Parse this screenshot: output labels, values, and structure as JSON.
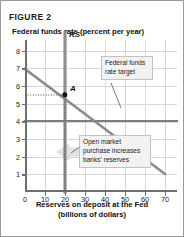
{
  "figure": {
    "title": "FIGURE 2",
    "y_axis_title": "Federal funds rate (percent per year)",
    "x_axis_title_line1": "Reserves on deposit at the Fed",
    "x_axis_title_line2": "(billions of dollars)"
  },
  "annotations": {
    "target_box": "Federal funds rate target",
    "omo_box": "Open market purchase increases banks' reserves",
    "point_a_label": "A",
    "supply_label": "RS",
    "demand_label": "RD"
  },
  "colors": {
    "curve": "#8a8a8a",
    "axis": "#6f6f6f",
    "grid": "#d8d8d8",
    "point": "#111111",
    "callout_bg": "#f2f2f2",
    "border": "#9a9a9a"
  },
  "chart_data": {
    "type": "line",
    "title": "FIGURE 2",
    "xlabel": "Reserves on deposit at the Fed (billions of dollars)",
    "ylabel": "Federal funds rate (percent per year)",
    "xlim": [
      0,
      76
    ],
    "ylim": [
      0,
      8.6
    ],
    "xticks": [
      0,
      10,
      20,
      30,
      40,
      50,
      60,
      70
    ],
    "yticks": [
      1,
      2,
      3,
      4,
      5,
      6,
      7,
      8
    ],
    "grid": true,
    "legend": "none",
    "series": [
      {
        "name": "RD",
        "label": "RD",
        "type": "line",
        "x": [
          0,
          70
        ],
        "y": [
          7,
          1
        ]
      },
      {
        "name": "RS",
        "label": "RS",
        "type": "vline",
        "x": [
          20,
          20
        ],
        "y": [
          0,
          8.4
        ]
      },
      {
        "name": "Federal funds rate target",
        "label": "Federal funds rate target",
        "type": "hline",
        "x": [
          0,
          76
        ],
        "y": [
          4,
          4
        ]
      }
    ],
    "points": [
      {
        "label": "A",
        "x": 20,
        "y": 5
      }
    ],
    "guides": [
      {
        "from": [
          0,
          5
        ],
        "to": [
          20,
          5
        ]
      },
      {
        "from": [
          20,
          5
        ],
        "to": [
          20,
          0
        ]
      }
    ],
    "annotations": [
      {
        "text": "Federal funds rate target",
        "x": 42,
        "y": 6.6
      },
      {
        "text": "Open market purchase increases banks' reserves",
        "x": 30,
        "y": 2.8
      }
    ]
  }
}
